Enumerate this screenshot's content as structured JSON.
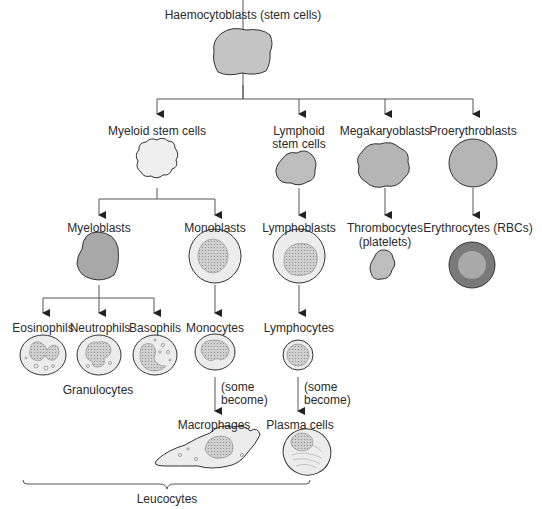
{
  "title": "Haemocytoblasts (stem cells)",
  "level1": {
    "myeloid": "Myeloid stem cells",
    "lymphoid_line1": "Lymphoid",
    "lymphoid_line2": "stem cells",
    "megakaryoblasts": "Megakaryoblasts",
    "proerythroblasts": "Proerythroblasts"
  },
  "level2": {
    "myeloblasts": "Myeloblasts",
    "monoblasts": "Monoblasts",
    "lymphoblasts": "Lymphoblasts",
    "thrombocytes_line1": "Thrombocytes",
    "thrombocytes_line2": "(platelets)",
    "erythrocytes": "Erythrocytes (RBCs)"
  },
  "level3": {
    "eosinophils": "Eosinophils",
    "neutrophils": "Neutrophils",
    "basophils": "Basophils",
    "monocytes": "Monocytes",
    "lymphocytes": "Lymphocytes",
    "granulocytes": "Granulocytes"
  },
  "transitions": {
    "some_line1": "(some",
    "some_line2": "become)"
  },
  "level4": {
    "macrophages": "Macrophages",
    "plasma_cells": "Plasma cells"
  },
  "group_label": "Leucocytes",
  "colors": {
    "cell_dark": "#a8a8a8",
    "cell_mid": "#bdbdbd",
    "cell_light": "#ececec",
    "nucleus": "#c8c8c8",
    "rbc_outer": "#7a7a7a",
    "rbc_inner": "#a9a9a9",
    "line": "#555555"
  }
}
